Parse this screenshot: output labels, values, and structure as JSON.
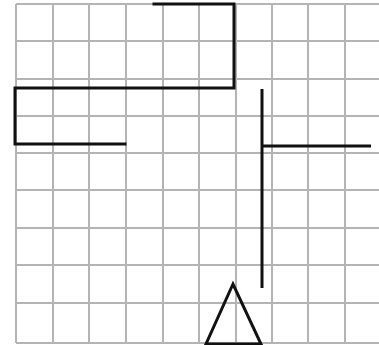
{
  "canvas": {
    "width": 379,
    "height": 345,
    "background": "#ffffff"
  },
  "grid": {
    "color": "#b4b4b4",
    "stroke_width": 2,
    "vertical_x": [
      16,
      53,
      89,
      126,
      163,
      199,
      236,
      272,
      308,
      345
    ],
    "horizontal_y": [
      4,
      41,
      79,
      116,
      153,
      190,
      228,
      265,
      303,
      343
    ],
    "x_extent": [
      16,
      379
    ],
    "y_extent": [
      4,
      343
    ]
  },
  "shapes": {
    "stroke_color": "#111111",
    "stroke_width": 3,
    "polyline_path": {
      "label": "path-shape",
      "points": [
        [
          154,
          4
        ],
        [
          234,
          4
        ],
        [
          234,
          88
        ],
        [
          15,
          88
        ],
        [
          15,
          144
        ],
        [
          125,
          144
        ]
      ]
    },
    "vertical_segment": {
      "label": "vertical-line",
      "x1": 262,
      "y1": 89,
      "x2": 262,
      "y2": 288
    },
    "horizontal_segment": {
      "label": "horizontal-line",
      "x1": 262,
      "y1": 146,
      "x2": 371,
      "y2": 146
    },
    "triangle": {
      "label": "triangle",
      "points": [
        [
          233,
          284
        ],
        [
          206,
          344
        ],
        [
          261,
          344
        ]
      ]
    }
  }
}
